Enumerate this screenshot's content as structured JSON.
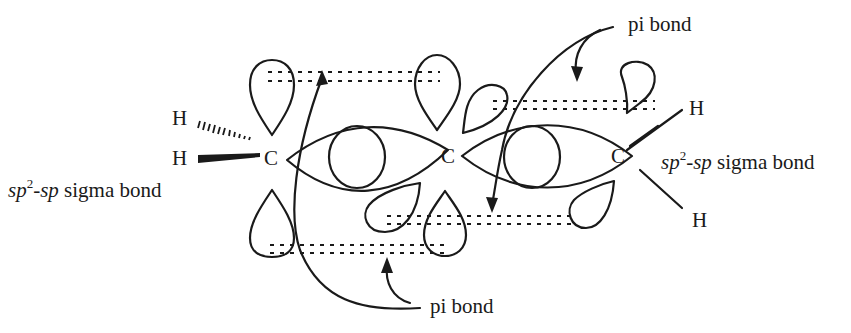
{
  "diagram": {
    "atoms": {
      "c_left": "C",
      "c_center": "C",
      "c_right": "C",
      "h_left_top": "H",
      "h_left_bottom": "H",
      "h_right_top": "H",
      "h_right_bottom": "H"
    },
    "labels": {
      "pi_bond_top": "pi bond",
      "pi_bond_bottom": "pi bond",
      "sigma_left": {
        "prefix": "sp",
        "sup": "2",
        "mid": "-sp",
        "suffix": " sigma bond"
      },
      "sigma_right": {
        "prefix": "sp",
        "sup": "2",
        "mid": "-sp",
        "suffix": " sigma bond"
      }
    },
    "colors": {
      "ink": "#1a1a1a",
      "background": "#ffffff"
    }
  }
}
